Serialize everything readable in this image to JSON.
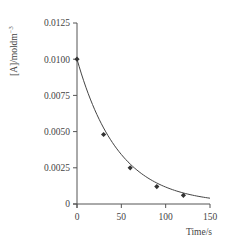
{
  "chart_data": {
    "type": "line",
    "title": "",
    "xlabel": "Time/s",
    "ylabel": "[A]/moldm",
    "ylabel_superscript": "−3",
    "xlim": [
      0,
      150
    ],
    "ylim": [
      0,
      0.0125
    ],
    "x_ticks": [
      0,
      50,
      100,
      150
    ],
    "x_tick_labels": [
      "0",
      "50",
      "100",
      "150"
    ],
    "y_ticks": [
      0,
      0.0025,
      0.005,
      0.0075,
      0.01,
      0.0125
    ],
    "y_tick_labels": [
      "0",
      "0.0025",
      "0.0050",
      "0.0075",
      "0.0100",
      "0.0125"
    ],
    "grid": false,
    "legend": null,
    "series": [
      {
        "name": "[A]",
        "marker": "diamond",
        "line": "smooth exponential decay curve",
        "x": [
          0,
          30,
          60,
          90,
          120
        ],
        "values": [
          0.01,
          0.0048,
          0.0025,
          0.0012,
          0.0006
        ]
      }
    ],
    "curve": {
      "model": "exponential decay",
      "x_start": 0,
      "x_end": 150,
      "initial_value": 0.01,
      "end_value": 0.0004
    }
  },
  "colors": {
    "axis": "#555555",
    "line": "#444444",
    "marker": "#333333",
    "background": "#ffffff"
  }
}
